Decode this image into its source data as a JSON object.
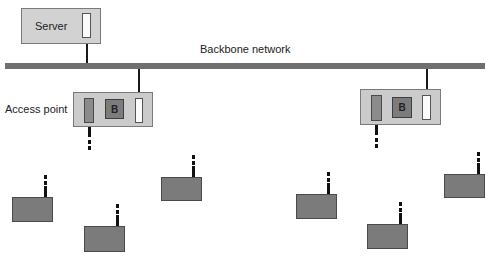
{
  "diagram": {
    "server": {
      "label": "Server"
    },
    "backbone": {
      "label": "Backbone network",
      "color": "#6f6f6f"
    },
    "access_point_label": "Access point",
    "access_points": [
      {
        "id": "ap-1",
        "bridge_label": "B"
      },
      {
        "id": "ap-2",
        "bridge_label": "B"
      }
    ],
    "wireless_stations": [
      {
        "id": "station-1"
      },
      {
        "id": "station-2"
      },
      {
        "id": "station-3"
      },
      {
        "id": "station-4"
      },
      {
        "id": "station-5"
      },
      {
        "id": "station-6"
      }
    ],
    "colors": {
      "server_fill": "#d2d2d2",
      "ap_fill": "#cbcbcb",
      "station_fill": "#7b7b7b",
      "bridge_fill": "#7c7c7c"
    }
  }
}
